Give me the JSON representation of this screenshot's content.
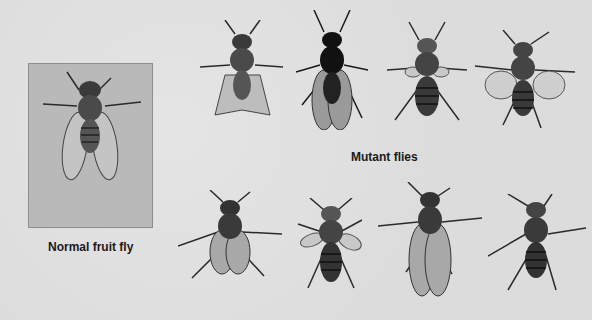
{
  "figure": {
    "background_color": "#dcdcdc",
    "normal_box_color": "#b9b9b9",
    "labels": {
      "normal": "Normal fruit fly",
      "mutant": "Mutant flies"
    },
    "flies": {
      "normal": {
        "name": "normal-fruit-fly",
        "wings": "normal"
      },
      "mutants": [
        {
          "name": "mutant-fly-1",
          "row": 1,
          "wings": "crumpled"
        },
        {
          "name": "mutant-fly-2",
          "row": 1,
          "wings": "dark-body"
        },
        {
          "name": "mutant-fly-3",
          "row": 1,
          "wings": "vestigial"
        },
        {
          "name": "mutant-fly-4",
          "row": 1,
          "wings": "spread-curled"
        },
        {
          "name": "mutant-fly-5",
          "row": 2,
          "wings": "short-spread"
        },
        {
          "name": "mutant-fly-6",
          "row": 2,
          "wings": "vestigial-small"
        },
        {
          "name": "mutant-fly-7",
          "row": 2,
          "wings": "long"
        },
        {
          "name": "mutant-fly-8",
          "row": 2,
          "wings": "wingless"
        }
      ]
    }
  }
}
